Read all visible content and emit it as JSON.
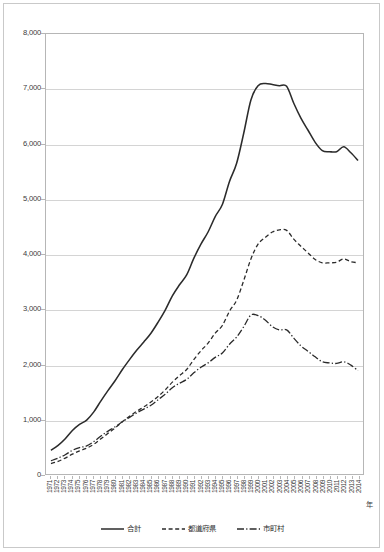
{
  "chart_data": {
    "type": "line",
    "title": "",
    "subtitle": "",
    "xlabel": "年",
    "ylabel": "",
    "ylim": [
      0,
      8000
    ],
    "ytick_labels": [
      "8,000",
      "7,000",
      "6,000",
      "5,000",
      "4,000",
      "3,000",
      "2,000",
      "1,000",
      "0"
    ],
    "ytick_values": [
      8000,
      7000,
      6000,
      5000,
      4000,
      3000,
      2000,
      1000,
      0
    ],
    "grid": "horizontal",
    "legend_position": "bottom",
    "x": [
      1971,
      1972,
      1973,
      1974,
      1975,
      1976,
      1977,
      1978,
      1979,
      1980,
      1981,
      1982,
      1983,
      1984,
      1985,
      1986,
      1987,
      1988,
      1989,
      1990,
      1991,
      1992,
      1993,
      1994,
      1995,
      1996,
      1997,
      1998,
      1999,
      2000,
      2001,
      2002,
      2003,
      2004,
      2005,
      2006,
      2007,
      2008,
      2009,
      2010,
      2011,
      2012,
      2013,
      2014
    ],
    "categories": [
      "1971",
      "1972",
      "1973",
      "1974",
      "1975",
      "1976",
      "1977",
      "1978",
      "1979",
      "1980",
      "1981",
      "1982",
      "1983",
      "1984",
      "1985",
      "1986",
      "1987",
      "1988",
      "1989",
      "1990",
      "1991",
      "1992",
      "1993",
      "1994",
      "1995",
      "1996",
      "1997",
      "1998",
      "1999",
      "2000",
      "2001",
      "2002",
      "2003",
      "2004",
      "2005",
      "2006",
      "2007",
      "2008",
      "2009",
      "2010",
      "2011",
      "2012",
      "2013",
      "2014"
    ],
    "series": [
      {
        "name": "合計",
        "style": "solid",
        "color": "#2b2b2b",
        "values": [
          430,
          520,
          640,
          790,
          900,
          980,
          1130,
          1330,
          1520,
          1700,
          1900,
          2080,
          2250,
          2400,
          2560,
          2760,
          2980,
          3240,
          3440,
          3620,
          3920,
          4180,
          4400,
          4680,
          4900,
          5320,
          5650,
          6200,
          6800,
          7060,
          7100,
          7080,
          7060,
          7050,
          6740,
          6470,
          6250,
          6030,
          5880,
          5860,
          5860,
          5950,
          5840,
          5700
        ]
      },
      {
        "name": "都道府県",
        "style": "dashed",
        "color": "#2b2b2b",
        "values": [
          190,
          230,
          290,
          360,
          420,
          470,
          540,
          640,
          740,
          840,
          950,
          1050,
          1140,
          1220,
          1310,
          1410,
          1530,
          1670,
          1790,
          1900,
          2080,
          2240,
          2380,
          2560,
          2700,
          2960,
          3160,
          3520,
          3910,
          4180,
          4300,
          4400,
          4440,
          4430,
          4270,
          4140,
          4020,
          3900,
          3840,
          3840,
          3850,
          3910,
          3860,
          3840
        ]
      },
      {
        "name": "市町村",
        "style": "dashdot",
        "color": "#2b2b2b",
        "values": [
          240,
          290,
          350,
          430,
          480,
          510,
          590,
          690,
          780,
          860,
          950,
          1030,
          1110,
          1180,
          1250,
          1350,
          1450,
          1570,
          1650,
          1720,
          1840,
          1940,
          2020,
          2120,
          2200,
          2360,
          2490,
          2680,
          2890,
          2880,
          2800,
          2680,
          2620,
          2620,
          2470,
          2330,
          2230,
          2130,
          2040,
          2020,
          2010,
          2040,
          1980,
          1880
        ]
      }
    ]
  },
  "legend": {
    "items": [
      {
        "label": "合計",
        "style": "solid"
      },
      {
        "label": "都道府県",
        "style": "dashed"
      },
      {
        "label": "市町村",
        "style": "dashdot"
      }
    ]
  },
  "axis": {
    "x_title": "年"
  },
  "colors": {
    "line": "#2b2b2b",
    "grid": "#d4d4d4",
    "axis": "#b6b6b6",
    "frame": "#c9c9c9",
    "text": "#3b3b3b"
  }
}
